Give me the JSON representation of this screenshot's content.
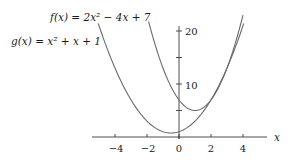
{
  "chart_data": {
    "type": "line",
    "title": "",
    "xlabel": "x",
    "ylabel": "",
    "xlim": [
      -5.4,
      5.5
    ],
    "ylim": [
      0,
      21
    ],
    "grid": false,
    "legend": "inline labels",
    "x_ticks": [
      -4,
      -2,
      0,
      2,
      4
    ],
    "x_tick_labels": [
      "−4",
      "−2",
      "0",
      "2",
      "4"
    ],
    "y_ticks": [
      5,
      10,
      15,
      20
    ],
    "y_tick_labels": [
      "",
      "10",
      "",
      "20"
    ],
    "series": [
      {
        "name": "f(x) = 2x² − 4x + 7",
        "coefficients": [
          2,
          -4,
          7
        ],
        "domain": [
          -1.9,
          4.0
        ],
        "vertex": [
          1,
          5
        ],
        "color": "#6a6a6a"
      },
      {
        "name": "g(x) = x² + x + 1",
        "coefficients": [
          1,
          1,
          1
        ],
        "domain": [
          -5.05,
          4.05
        ],
        "vertex": [
          -0.5,
          0.75
        ],
        "color": "#6a6a6a"
      }
    ],
    "annotations": [
      {
        "text": "f(x) = 2x² − 4x + 7",
        "target": "f"
      },
      {
        "text": "g(x) = x² + x + 1",
        "target": "g"
      }
    ],
    "intersections": [
      [
        2,
        7
      ],
      [
        3,
        13
      ]
    ]
  },
  "labels": {
    "f": "f(x) = 2x² − 4x + 7",
    "g": "g(x) = x² + x + 1",
    "x_axis": "x",
    "x_ticks": [
      "−4",
      "−2",
      "0",
      "2",
      "4"
    ],
    "y_ticks": {
      "y10": "10",
      "y20": "20"
    }
  }
}
